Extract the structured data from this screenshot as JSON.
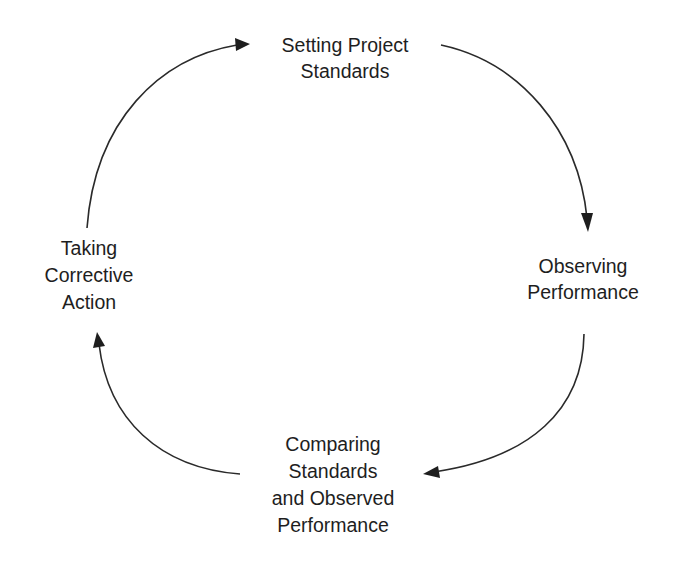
{
  "diagram": {
    "type": "cycle",
    "direction": "clockwise",
    "nodes": [
      {
        "id": "setting",
        "position": "top",
        "lines": [
          "Setting Project",
          "Standards"
        ]
      },
      {
        "id": "observing",
        "position": "right",
        "lines": [
          "Observing",
          "Performance"
        ]
      },
      {
        "id": "comparing",
        "position": "bottom",
        "lines": [
          "Comparing",
          "Standards",
          "and Observed",
          "Performance"
        ]
      },
      {
        "id": "corrective",
        "position": "left",
        "lines": [
          "Taking",
          "Corrective",
          "Action"
        ]
      }
    ],
    "edges": [
      {
        "from": "setting",
        "to": "observing"
      },
      {
        "from": "observing",
        "to": "comparing"
      },
      {
        "from": "comparing",
        "to": "corrective"
      },
      {
        "from": "corrective",
        "to": "setting"
      }
    ],
    "colors": {
      "background": "#ffffff",
      "text": "#1e1e1e",
      "arrow": "#2a2a2a"
    }
  }
}
